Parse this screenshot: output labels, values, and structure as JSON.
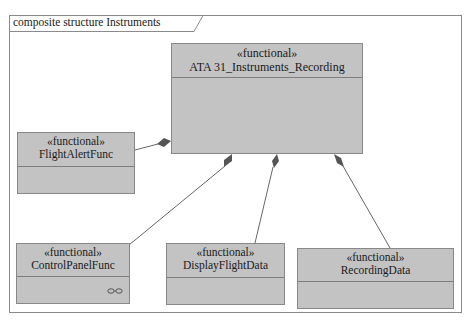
{
  "frame": {
    "title": "composite structure Instruments"
  },
  "blocks": {
    "main": {
      "stereotype": "«functional»",
      "name": "ATA 31_Instruments_Recording"
    },
    "flight_alert": {
      "stereotype": "«functional»",
      "name": "FlightAlertFunc"
    },
    "control_panel": {
      "stereotype": "«functional»",
      "name": "ControlPanelFunc",
      "icon": "decomposition-rake-icon"
    },
    "display_flight": {
      "stereotype": "«functional»",
      "name": "DisplayFlightData"
    },
    "recording": {
      "stereotype": "«functional»",
      "name": "RecordingData"
    }
  },
  "colors": {
    "block_fill": "#c3c3c3",
    "block_border": "#888888",
    "line": "#666666",
    "diamond": "#555555"
  }
}
